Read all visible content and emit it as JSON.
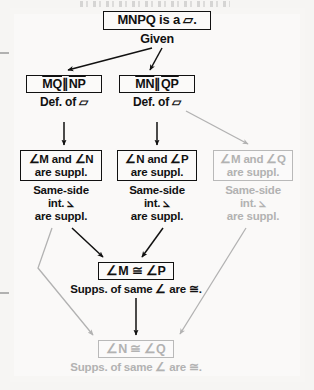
{
  "document": {
    "type": "geometry-flowchart-proof",
    "background_color": "#f6f5f3",
    "ink_color": "#111111",
    "faded_color": "#b2b2b2"
  },
  "nodes": {
    "given": {
      "text": "MNPQ is a ▱.",
      "reason": "Given",
      "faded": false
    },
    "mq_np": {
      "text": "MQ ∥ NP",
      "reason": "Def. of ▱",
      "faded": false
    },
    "mn_qp": {
      "text": "MN ∥ QP",
      "reason": "Def. of ▱",
      "faded": false
    },
    "angle_m_n": {
      "text": "∠M and ∠N\nare suppl.",
      "reason": "Same-side\nint. ⦣\nare suppl.",
      "faded": false
    },
    "angle_n_p": {
      "text": "∠N and ∠P\nare suppl.",
      "reason": "Same-side\nint. ⦣\nare suppl.",
      "faded": false
    },
    "angle_m_q": {
      "text": "∠M and ∠Q\nare suppl.",
      "reason": "Same-side\nint. ⦣\nare suppl.",
      "faded": true
    },
    "m_cong_p": {
      "text": "∠M ≅ ∠P",
      "reason": "Supps. of same ∠ are ≅.",
      "faded": false
    },
    "n_cong_q": {
      "text": "∠N ≅ ∠Q",
      "reason": "Supps. of same ∠ are ≅.",
      "faded": true
    }
  }
}
